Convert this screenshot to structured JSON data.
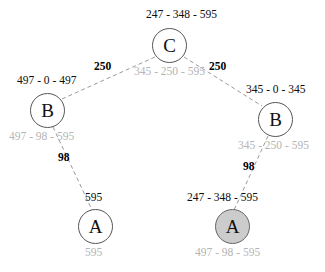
{
  "diagram": {
    "type": "tree",
    "title": "",
    "background_color": "#ffffff",
    "edge_style": "dashed",
    "nodes": [
      {
        "id": "root",
        "label": "C",
        "shaded": false,
        "top_label": "247 - 348 - 595",
        "bottom_label": "345 - 250 - 595"
      },
      {
        "id": "left-b",
        "label": "B",
        "shaded": false,
        "top_label": "497 - 0 - 497",
        "bottom_label": "497 - 98 - 595"
      },
      {
        "id": "right-b",
        "label": "B",
        "shaded": false,
        "top_label": "345 - 0 - 345",
        "bottom_label": "345 - 250 - 595"
      },
      {
        "id": "left-a",
        "label": "A",
        "shaded": false,
        "top_label": "595",
        "bottom_label": "595"
      },
      {
        "id": "right-a",
        "label": "A",
        "shaded": true,
        "shade_color": "#cccccc",
        "top_label": "247 - 348 - 595",
        "bottom_label": "497 - 98 - 595"
      }
    ],
    "edges": [
      {
        "id": "root-left-b",
        "from": "root",
        "to": "left-b",
        "weight": "250"
      },
      {
        "id": "root-right-b",
        "from": "root",
        "to": "right-b",
        "weight": "250"
      },
      {
        "id": "left-b-left-a",
        "from": "left-b",
        "to": "left-a",
        "weight": "98"
      },
      {
        "id": "right-b-right-a",
        "from": "right-b",
        "to": "right-a",
        "weight": "98"
      }
    ]
  },
  "colors": {
    "node_stroke": "#555555",
    "node_fill": "#ffffff",
    "shaded_node_fill": "#cccccc",
    "edge": "#999999",
    "primary_text": "#0d0d0d",
    "secondary_text": "#b4b4b4"
  }
}
